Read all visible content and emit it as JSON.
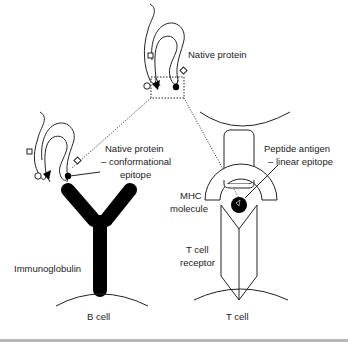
{
  "diagram": {
    "type": "immunology-schematic",
    "labels": {
      "native_protein_top": "Native protein",
      "native_protein_left_line1": "Native protein",
      "native_protein_left_line2": "– conformational",
      "native_protein_left_line3": "epitope",
      "peptide_line1": "Peptide antigen",
      "peptide_line2": "– linear epitope",
      "mhc_line1": "MHC",
      "mhc_line2": "molecule",
      "tcr_line1": "T cell",
      "tcr_line2": "receptor",
      "immunoglobulin": "Immunoglobulin",
      "b_cell": "B cell",
      "t_cell": "T cell"
    },
    "nodes": [
      {
        "id": "native-protein-top",
        "label": "Native protein"
      },
      {
        "id": "native-protein-bcell",
        "label": "Native protein – conformational epitope"
      },
      {
        "id": "immunoglobulin",
        "label": "Immunoglobulin"
      },
      {
        "id": "b-cell",
        "label": "B cell"
      },
      {
        "id": "mhc",
        "label": "MHC molecule"
      },
      {
        "id": "peptide",
        "label": "Peptide antigen – linear epitope"
      },
      {
        "id": "tcr",
        "label": "T cell receptor"
      },
      {
        "id": "t-cell",
        "label": "T cell"
      }
    ],
    "edges": [
      {
        "from": "native-protein-top",
        "to": "native-protein-bcell",
        "style": "dotted"
      },
      {
        "from": "native-protein-top",
        "to": "peptide",
        "style": "dotted"
      }
    ],
    "colors": {
      "stroke": "#222222",
      "fill": "#000000",
      "background": "#ffffff",
      "rule": "#b8b8b8"
    }
  }
}
